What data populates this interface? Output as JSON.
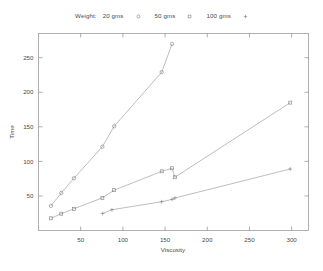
{
  "legend": {
    "title": "Weight:",
    "entries": [
      {
        "label": "20 gms",
        "marker": "circle-marker"
      },
      {
        "label": "50 gms",
        "marker": "square-marker"
      },
      {
        "label": "100 gms",
        "marker": "plus-marker"
      }
    ]
  },
  "chart_data": {
    "type": "line",
    "title": "",
    "xlabel": "Viscosity",
    "ylabel": "Time",
    "xlim": [
      0,
      320
    ],
    "ylim": [
      0,
      285
    ],
    "xticks": [
      50,
      100,
      150,
      200,
      250,
      300
    ],
    "yticks": [
      50,
      100,
      150,
      200,
      250
    ],
    "grid": false,
    "legend_position": "top-center",
    "series": [
      {
        "name": "20 gms",
        "marker": "circle",
        "x": [
          14.7,
          27.0,
          42.0,
          75.7,
          89.7,
          146.0,
          158.3
        ],
        "y": [
          35.6,
          54.3,
          75.6,
          121.2,
          150.8,
          229.0,
          270.0
        ]
      },
      {
        "name": "50 gms",
        "marker": "square",
        "x": [
          14.7,
          27.0,
          42.0,
          75.7,
          89.7,
          146.0,
          158.3,
          161.6,
          298.4
        ],
        "y": [
          17.6,
          24.3,
          31.4,
          47.2,
          58.3,
          85.6,
          90.0,
          77.0,
          185.0
        ]
      },
      {
        "name": "100 gms",
        "marker": "plus",
        "x": [
          76.0,
          87.0,
          146.0,
          158.3,
          161.6,
          298.4
        ],
        "y": [
          24.6,
          30.0,
          41.7,
          45.0,
          47.0,
          89.0
        ]
      }
    ]
  }
}
